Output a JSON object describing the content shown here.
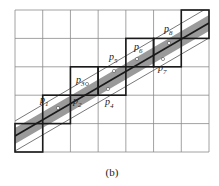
{
  "figure": {
    "caption": "(b)",
    "grid": {
      "cols": 7,
      "rows": 5,
      "x0": 15,
      "y0": 10,
      "x1": 209,
      "y1": 152
    },
    "colors": {
      "grid": "#8a8a8a",
      "band_fill": "#9a9a9a",
      "thick": "#1a1a1a",
      "thin_line": "#555555"
    },
    "highlighted_cells": [
      {
        "col": 0,
        "row": 4
      },
      {
        "col": 1,
        "row": 3
      },
      {
        "col": 2,
        "row": 2
      },
      {
        "col": 3,
        "row": 2
      },
      {
        "col": 4,
        "row": 1
      },
      {
        "col": 5,
        "row": 1
      },
      {
        "col": 6,
        "row": 0
      }
    ],
    "points": [
      {
        "label": "p",
        "sub": "1",
        "x": 40,
        "y": 103
      },
      {
        "label": "p",
        "sub": "2",
        "x": 73,
        "y": 104
      },
      {
        "label": "p",
        "sub": "3",
        "x": 76,
        "y": 83
      },
      {
        "label": "p",
        "sub": "4",
        "x": 105,
        "y": 105
      },
      {
        "label": "p",
        "sub": "5",
        "x": 109,
        "y": 60
      },
      {
        "label": "p",
        "sub": "6",
        "x": 134,
        "y": 50
      },
      {
        "label": "p",
        "sub": "7",
        "x": 158,
        "y": 71
      },
      {
        "label": "p",
        "sub": "8",
        "x": 164,
        "y": 32
      }
    ],
    "dots": [
      {
        "x": 58,
        "y": 108
      },
      {
        "x": 87,
        "y": 84
      },
      {
        "x": 108,
        "y": 89
      },
      {
        "x": 114,
        "y": 71
      },
      {
        "x": 137,
        "y": 59
      },
      {
        "x": 163,
        "y": 59
      },
      {
        "x": 169,
        "y": 43
      }
    ]
  }
}
